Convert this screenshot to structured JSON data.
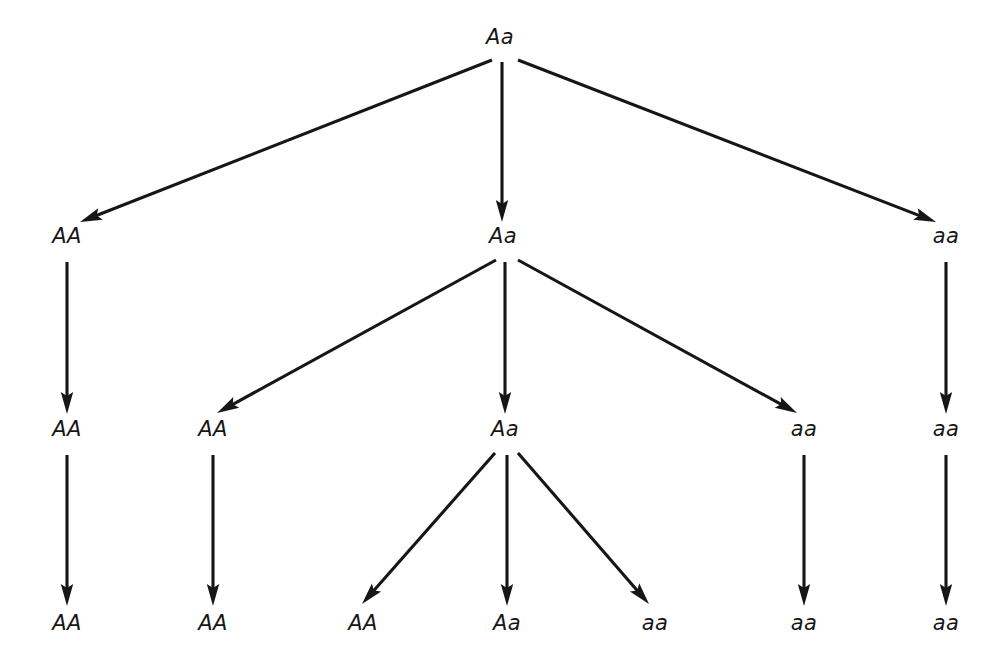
{
  "diagram": {
    "background_color": "#ffffff",
    "line_color": "#161616",
    "text_color": "#161616",
    "width": 1007,
    "height": 658,
    "generations": 4,
    "arrow_style": "straight line with solid triangular arrowhead",
    "nodes": [
      {
        "id": "g1n1",
        "label": "Aa",
        "generation": 1,
        "x": 500,
        "y": 44
      },
      {
        "id": "g2n1",
        "label": "AA",
        "generation": 2,
        "x": 67,
        "y": 243
      },
      {
        "id": "g2n2",
        "label": "Aa",
        "generation": 2,
        "x": 503,
        "y": 243
      },
      {
        "id": "g2n3",
        "label": "aa",
        "generation": 2,
        "x": 946,
        "y": 243
      },
      {
        "id": "g3n1",
        "label": "AA",
        "generation": 3,
        "x": 67,
        "y": 436
      },
      {
        "id": "g3n2",
        "label": "AA",
        "generation": 3,
        "x": 213,
        "y": 436
      },
      {
        "id": "g3n3",
        "label": "Aa",
        "generation": 3,
        "x": 505,
        "y": 436
      },
      {
        "id": "g3n4",
        "label": "aa",
        "generation": 3,
        "x": 804,
        "y": 436
      },
      {
        "id": "g3n5",
        "label": "aa",
        "generation": 3,
        "x": 946,
        "y": 436
      },
      {
        "id": "g4n1",
        "label": "AA",
        "generation": 4,
        "x": 67,
        "y": 630
      },
      {
        "id": "g4n2",
        "label": "AA",
        "generation": 4,
        "x": 213,
        "y": 630
      },
      {
        "id": "g4n3",
        "label": "AA",
        "generation": 4,
        "x": 363,
        "y": 630
      },
      {
        "id": "g4n4",
        "label": "Aa",
        "generation": 4,
        "x": 507,
        "y": 630
      },
      {
        "id": "g4n5",
        "label": "aa",
        "generation": 4,
        "x": 655,
        "y": 630
      },
      {
        "id": "g4n6",
        "label": "aa",
        "generation": 4,
        "x": 804,
        "y": 630
      },
      {
        "id": "g4n7",
        "label": "aa",
        "generation": 4,
        "x": 946,
        "y": 630
      }
    ],
    "edges": [
      {
        "from": "g1n1",
        "to": "g2n1",
        "x1": 492,
        "y1": 60,
        "x2": 80,
        "y2": 222
      },
      {
        "from": "g1n1",
        "to": "g2n2",
        "x1": 502,
        "y1": 62,
        "x2": 502,
        "y2": 222
      },
      {
        "from": "g1n1",
        "to": "g2n3",
        "x1": 518,
        "y1": 60,
        "x2": 936,
        "y2": 222
      },
      {
        "from": "g2n1",
        "to": "g3n1",
        "x1": 67,
        "y1": 262,
        "x2": 67,
        "y2": 414
      },
      {
        "from": "g2n2",
        "to": "g3n2",
        "x1": 496,
        "y1": 260,
        "x2": 217,
        "y2": 413
      },
      {
        "from": "g2n2",
        "to": "g3n3",
        "x1": 505,
        "y1": 262,
        "x2": 505,
        "y2": 414
      },
      {
        "from": "g2n2",
        "to": "g3n4",
        "x1": 518,
        "y1": 260,
        "x2": 797,
        "y2": 413
      },
      {
        "from": "g2n3",
        "to": "g3n5",
        "x1": 946,
        "y1": 262,
        "x2": 946,
        "y2": 414
      },
      {
        "from": "g3n1",
        "to": "g4n1",
        "x1": 67,
        "y1": 455,
        "x2": 67,
        "y2": 606
      },
      {
        "from": "g3n2",
        "to": "g4n2",
        "x1": 213,
        "y1": 455,
        "x2": 213,
        "y2": 606
      },
      {
        "from": "g3n3",
        "to": "g4n3",
        "x1": 495,
        "y1": 453,
        "x2": 362,
        "y2": 604
      },
      {
        "from": "g3n3",
        "to": "g4n4",
        "x1": 507,
        "y1": 455,
        "x2": 507,
        "y2": 606
      },
      {
        "from": "g3n3",
        "to": "g4n5",
        "x1": 518,
        "y1": 453,
        "x2": 649,
        "y2": 604
      },
      {
        "from": "g3n4",
        "to": "g4n6",
        "x1": 804,
        "y1": 455,
        "x2": 804,
        "y2": 606
      },
      {
        "from": "g3n5",
        "to": "g4n7",
        "x1": 946,
        "y1": 455,
        "x2": 946,
        "y2": 606
      }
    ]
  }
}
